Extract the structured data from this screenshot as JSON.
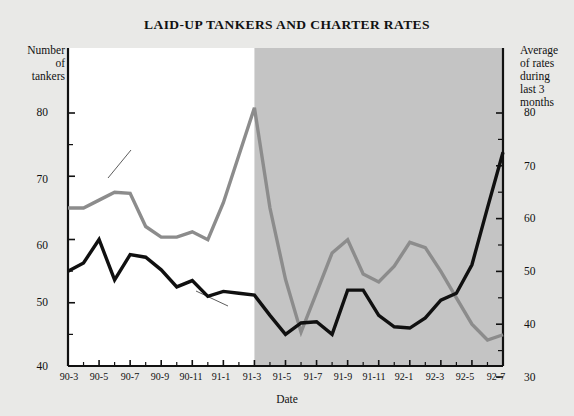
{
  "chart_data": {
    "type": "line",
    "title": "LAID-UP TANKERS AND CHARTER RATES",
    "xlabel": "Date",
    "ylabel_left": "Number of tankers",
    "ylabel_right": "Average of rates during last 3 months",
    "grid": false,
    "legend_position": "inline-annotations",
    "ylim_left": [
      40,
      85
    ],
    "ylim_right": [
      30,
      85
    ],
    "yticks_left": [
      40,
      50,
      60,
      70,
      80
    ],
    "yticks_right": [
      30,
      40,
      50,
      60,
      70,
      80
    ],
    "yticks_left_minor": [
      45,
      55,
      65,
      75
    ],
    "yticks_right_minor": [
      35,
      45,
      55,
      65,
      75
    ],
    "x": [
      "90-3",
      "90-4",
      "90-5",
      "90-6",
      "90-7",
      "90-8",
      "90-9",
      "90-10",
      "90-11",
      "90-12",
      "91-1",
      "91-2",
      "91-3",
      "91-4",
      "91-5",
      "91-6",
      "91-7",
      "91-8",
      "91-9",
      "91-10",
      "91-11",
      "91-12",
      "92-1",
      "92-2",
      "92-3",
      "92-4",
      "92-5",
      "92-6",
      "92-7"
    ],
    "xtick_labels": [
      "90-3",
      "90-5",
      "90-7",
      "90-9",
      "90-11",
      "91-1",
      "91-3",
      "91-5",
      "91-7",
      "91-9",
      "91-11",
      "92-1",
      "92-3",
      "92-5",
      "92-7"
    ],
    "shaded_region": {
      "from": "91-3",
      "to": "92-7",
      "color": "#c4c4c4",
      "label": "forecast/highlight band"
    },
    "plot_background": "#ffffff",
    "series": [
      {
        "name": "Number of laid-up tankers",
        "axis": "left",
        "color": "#101010",
        "values": [
          55.0,
          56.3,
          60.0,
          53.6,
          57.6,
          57.2,
          55.2,
          52.5,
          53.5,
          51.0,
          51.8,
          51.5,
          51.2,
          48.0,
          45.0,
          46.8,
          47.0,
          45.0,
          52.0,
          52.0,
          48.0,
          46.2,
          46.0,
          47.6,
          50.4,
          51.5,
          56.0,
          65.0,
          73.8
        ]
      },
      {
        "name": "Average charter rate during last 3 months",
        "axis": "right",
        "color": "#8c8c8c",
        "values": [
          62.0,
          62.0,
          63.5,
          65.0,
          64.8,
          58.5,
          56.5,
          56.5,
          57.5,
          56.0,
          63.0,
          72.0,
          81.0,
          62.0,
          48.5,
          38.5,
          46.0,
          53.5,
          56.0,
          49.5,
          48.0,
          51.0,
          55.5,
          54.5,
          50.0,
          45.0,
          40.0,
          37.0,
          38.0
        ]
      }
    ],
    "annotations": [
      {
        "name": "gray-series-annotation",
        "text": "Average charter rate during last 3 months",
        "lines": [
          "Average charter",
          "rate during",
          "last 3 months"
        ]
      },
      {
        "name": "black-series-annotation",
        "text": "Number of laid-up tankers",
        "lines": [
          "Number of",
          "laid-up tankers"
        ]
      }
    ]
  },
  "labels": {
    "title": "LAID-UP TANKERS AND CHARTER RATES",
    "left_axis": {
      "l1": "Number",
      "l2": "of",
      "l3": "tankers"
    },
    "right_axis": {
      "l1": "Average",
      "l2": "of rates",
      "l3": "during",
      "l4": "last 3",
      "l5": "months"
    },
    "xaxis_title": "Date",
    "yticks_left": [
      "80",
      "70",
      "60",
      "50",
      "40"
    ],
    "yticks_right": [
      "80",
      "70",
      "60",
      "50",
      "40",
      "30"
    ],
    "xticks": [
      "90-3",
      "90-5",
      "90-7",
      "90-9",
      "90-11",
      "91-1",
      "91-3",
      "91-5",
      "91-7",
      "91-9",
      "91-11",
      "92-1",
      "92-3",
      "92-5",
      "92-7"
    ],
    "annot_gray": {
      "l1": "Average charter",
      "l2": "rate during",
      "l3": "last 3 months"
    },
    "annot_black": {
      "l1": "Number of",
      "l2": "laid-up tankers"
    }
  },
  "colors": {
    "page_background": "#e9e9e7",
    "plot_background": "#ffffff",
    "shade": "#c4c4c4",
    "black_series": "#101010",
    "gray_series": "#8c8c8c",
    "axis": "#111111"
  }
}
